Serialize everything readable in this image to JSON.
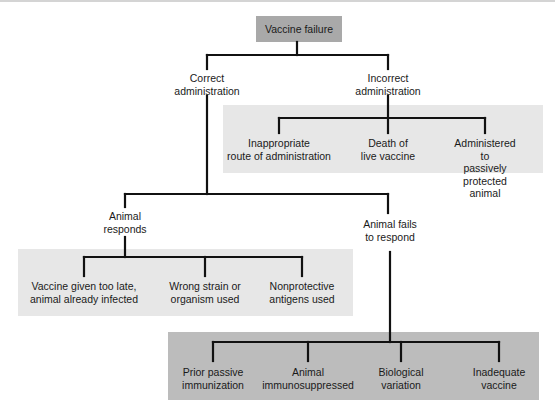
{
  "diagram": {
    "root": "Vaccine failure",
    "level1": {
      "left": "Correct\nadministration",
      "right": "Incorrect\nadministration"
    },
    "incorrect_causes": [
      "Inappropriate\nroute of administration",
      "Death of\nlive vaccine",
      "Administered to\npassively protected\nanimal"
    ],
    "level2": {
      "left": "Animal\nresponds",
      "right": "Animal fails\nto respond"
    },
    "responds_causes": [
      "Vaccine given too late,\nanimal already infected",
      "Wrong strain or\norganism used",
      "Nonprotective\nantigens used"
    ],
    "fails_causes": [
      "Prior passive\nimmunization",
      "Animal\nimmunosuppressed",
      "Biological\nvariation",
      "Inadequate\nvaccine"
    ],
    "colors": {
      "root_fill": "#a9a9a9",
      "light_group_fill": "#e7e7e7",
      "dark_group_fill": "#bcbcbc",
      "connector": "#111111"
    }
  }
}
